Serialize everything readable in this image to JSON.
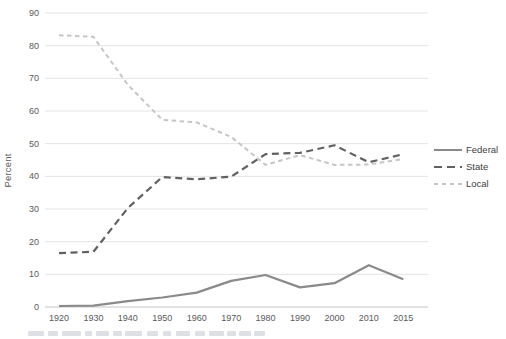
{
  "figure": {
    "y_axis_title": "Percent"
  },
  "chart_data": {
    "type": "line",
    "title": "",
    "xlabel": "",
    "ylabel": "Percent",
    "categories": [
      "1920",
      "1930",
      "1940",
      "1950",
      "1960",
      "1970",
      "1980",
      "1990",
      "2000",
      "2010",
      "2015"
    ],
    "series": [
      {
        "name": "Federal",
        "dash": "solid",
        "color": "#8a8a8a",
        "values": [
          0.3,
          0.4,
          1.8,
          2.9,
          4.4,
          8.0,
          9.8,
          6.0,
          7.3,
          12.8,
          8.5
        ]
      },
      {
        "name": "State",
        "dash": "long",
        "color": "#616161",
        "values": [
          16.5,
          16.9,
          30.3,
          39.8,
          39.1,
          39.9,
          46.8,
          47.2,
          49.5,
          44.3,
          46.8
        ]
      },
      {
        "name": "Local",
        "dash": "short",
        "color": "#c6c6c6",
        "values": [
          83.2,
          82.7,
          68.0,
          57.3,
          56.5,
          52.1,
          43.5,
          46.5,
          43.5,
          43.6,
          45.3
        ]
      }
    ],
    "ylim": [
      0,
      90
    ],
    "ytick_step": 10,
    "yticks": [
      0,
      10,
      20,
      30,
      40,
      50,
      60,
      70,
      80,
      90
    ],
    "grid": true,
    "legend_position": "right",
    "colors": {
      "gridline": "#e4e4e4",
      "axis_line": "#c6c6c6",
      "tick_label": "#595959",
      "legend_text": "#404040",
      "background": "#ffffff"
    }
  }
}
